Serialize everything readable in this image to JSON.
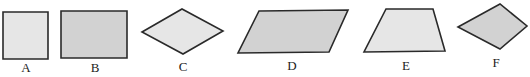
{
  "diagram": {
    "colors": {
      "stroke": "#2a2a2a",
      "light_fill": "#e6e6e6",
      "gray_fill": "#d2d2d2",
      "background": "#ffffff"
    },
    "shapes": [
      {
        "label": "A",
        "kind": "square",
        "fill": "#e6e6e6",
        "points": "3,12 48,12 48,59 3,59",
        "label_pos": [
          26,
          72
        ]
      },
      {
        "label": "B",
        "kind": "rectangle",
        "fill": "#d2d2d2",
        "points": "61,11 127,11 127,58 61,58",
        "label_pos": [
          95,
          72
        ]
      },
      {
        "label": "C",
        "kind": "rhombus",
        "fill": "#e6e6e6",
        "points": "142,32 182,9 223,31 183,54",
        "label_pos": [
          183,
          71
        ]
      },
      {
        "label": "D",
        "kind": "parallelogram",
        "fill": "#d2d2d2",
        "points": "259,11 348,10 329,52 238,53",
        "label_pos": [
          292,
          70
        ]
      },
      {
        "label": "E",
        "kind": "trapezoid",
        "fill": "#e6e6e6",
        "points": "386,9 433,9 445,51 364,52",
        "label_pos": [
          406,
          70
        ]
      },
      {
        "label": "F",
        "kind": "kite",
        "fill": "#d2d2d2",
        "points": "458,27 500,4 527,26 500,49",
        "label_pos": [
          496,
          67
        ]
      }
    ]
  }
}
